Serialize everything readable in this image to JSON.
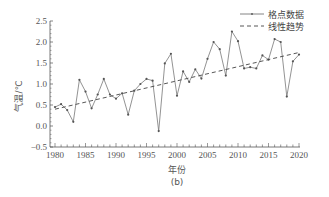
{
  "chart_data": {
    "type": "line",
    "title": "",
    "caption": "(b)",
    "xlabel": "年份",
    "ylabel": "气温/℃",
    "xlim": [
      1980,
      2020
    ],
    "ylim": [
      -0.5,
      2.5
    ],
    "xticks": [
      1980,
      1985,
      1990,
      1995,
      2000,
      2005,
      2010,
      2015,
      2020
    ],
    "xtick_labels": [
      "1980",
      "1985",
      "1990",
      "1995",
      "2000",
      "2005",
      "2010",
      "2015",
      "2020"
    ],
    "yticks": [
      -0.5,
      0.0,
      0.5,
      1.0,
      1.5,
      2.0,
      2.5
    ],
    "ytick_labels": [
      "-0.5",
      "0.0",
      "0.5",
      "1.0",
      "1.5",
      "2.0",
      "2.5"
    ],
    "grid": false,
    "legend_position": "upper right",
    "x": [
      1980,
      1981,
      1982,
      1983,
      1984,
      1985,
      1986,
      1987,
      1988,
      1989,
      1990,
      1991,
      1992,
      1993,
      1994,
      1995,
      1996,
      1997,
      1998,
      1999,
      2000,
      2001,
      2002,
      2003,
      2004,
      2005,
      2006,
      2007,
      2008,
      2009,
      2010,
      2011,
      2012,
      2013,
      2014,
      2015,
      2016,
      2017,
      2018,
      2019,
      2020
    ],
    "series": [
      {
        "name": "格点数据",
        "style": "solid-with-markers",
        "color": "#666666",
        "values": [
          0.45,
          0.52,
          0.38,
          0.1,
          1.1,
          0.82,
          0.42,
          0.75,
          1.12,
          0.75,
          0.65,
          0.78,
          0.27,
          0.84,
          1.0,
          1.12,
          1.08,
          -0.12,
          1.49,
          1.72,
          0.72,
          1.3,
          1.05,
          1.35,
          1.13,
          1.6,
          2.0,
          1.83,
          1.2,
          2.25,
          2.02,
          1.37,
          1.4,
          1.37,
          1.68,
          1.58,
          2.07,
          2.0,
          0.7,
          1.54,
          1.7
        ]
      },
      {
        "name": "线性趋势",
        "style": "dashed",
        "color": "#444444",
        "start": [
          1980,
          0.4
        ],
        "end": [
          2020,
          1.75
        ]
      }
    ]
  },
  "legend": {
    "items": [
      {
        "label": "格点数据"
      },
      {
        "label": "线性趋势"
      }
    ]
  },
  "labels": {
    "xlabel": "年份",
    "ylabel": "气温/℃",
    "caption": "(b)"
  }
}
